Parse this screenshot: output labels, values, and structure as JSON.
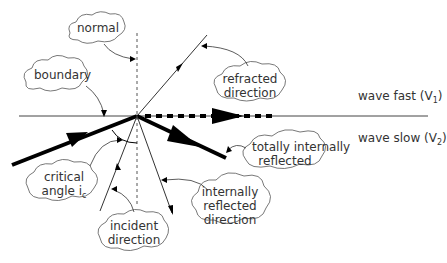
{
  "diagram": {
    "type": "ray refraction / total internal reflection",
    "colors": {
      "line": "#000000",
      "text": "#333333",
      "cloud_stroke": "#555555",
      "background": "#ffffff"
    },
    "labels": {
      "normal": "normal",
      "boundary": "boundary",
      "refracted_1": "refracted",
      "refracted_2": "direction",
      "tir_1": "totally internally",
      "tir_2": "reflected",
      "critical_1": "critical",
      "critical_2": "angle i",
      "critical_sub": "c",
      "incident_1": "incident",
      "incident_2": "direction",
      "irefl_1": "internally",
      "irefl_2": "reflected",
      "irefl_3": "direction"
    },
    "media": {
      "fast": {
        "text": "wave fast (V",
        "sub": "1",
        "close": ")"
      },
      "slow": {
        "text": "wave slow (V",
        "sub": "2",
        "close": ")"
      }
    }
  }
}
